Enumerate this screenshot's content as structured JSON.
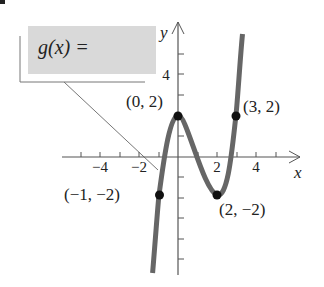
{
  "formula_box": {
    "label": "g(x) =",
    "fill": "#d9d9d9"
  },
  "axes": {
    "x_label": "x",
    "y_label": "y",
    "x_tick_labels": [
      "−4",
      "−2",
      "2",
      "4"
    ],
    "y_tick_labels": [
      "4"
    ]
  },
  "points": [
    {
      "label": "(0, 2)",
      "x": 0,
      "y": 2
    },
    {
      "label": "(3, 2)",
      "x": 3,
      "y": 2
    },
    {
      "label": "(−1, −2)",
      "x": -1,
      "y": -2
    },
    {
      "label": "(2, −2)",
      "x": 2,
      "y": -2
    }
  ],
  "colors": {
    "curve": "#666666",
    "axis": "#555555",
    "point": "#111111",
    "text": "#222222"
  }
}
